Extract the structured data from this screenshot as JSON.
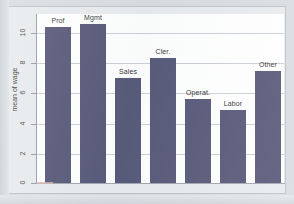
{
  "figure": {
    "background_color": "#d6dbdf",
    "panel_color": "#e7eaec",
    "plot_color": "#ffffff",
    "bar_color": "#4a4c6e",
    "grid_color": "#c8ccd2",
    "axis_color": "#8f969d"
  },
  "axis": {
    "y_title": "mean of wage",
    "y_ticks": [
      "0",
      "2",
      "4",
      "6",
      "8",
      "10"
    ],
    "y_tick_values": [
      0,
      2,
      4,
      6,
      8,
      10
    ]
  },
  "chart_data": {
    "type": "bar",
    "title": "",
    "subtitle": "",
    "xlabel": "",
    "ylabel": "mean of wage",
    "categories": [
      "Prof",
      "Mgmt",
      "Sales",
      "Cler.",
      "Operat.",
      "Labor",
      "Other"
    ],
    "values": [
      10.6,
      10.8,
      7.15,
      8.5,
      5.7,
      4.95,
      7.6
    ],
    "bar_labels": [
      "Prof",
      "Mgmt",
      "Sales",
      "Cler.",
      "Operat.",
      "Labor",
      "Other"
    ],
    "ylim": [
      0,
      11.5
    ],
    "y_ticks": [
      0,
      2,
      4,
      6,
      8,
      10
    ],
    "grid": true,
    "grid_axis": "y",
    "legend": false,
    "legend_position": "none",
    "series": [
      {
        "name": "mean of wage",
        "values": [
          10.6,
          10.8,
          7.15,
          8.5,
          5.7,
          4.95,
          7.6
        ]
      }
    ]
  }
}
